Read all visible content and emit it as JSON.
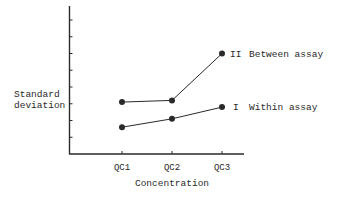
{
  "chart_data": {
    "type": "line",
    "title": "",
    "xlabel": "Concentration",
    "ylabel": "Standard deviation",
    "ylabel_lines": [
      "Standard",
      "deviation"
    ],
    "categories": [
      "QC1",
      "QC2",
      "QC3"
    ],
    "ylim": [
      0,
      8
    ],
    "yticks_count": 8,
    "ytick_labels": [],
    "grid": false,
    "legend_position": "inline-right",
    "series": [
      {
        "name": "Between assay",
        "marker_label": "II",
        "values": [
          3.1,
          3.2,
          6.0
        ]
      },
      {
        "name": "Within assay",
        "marker_label": "I",
        "values": [
          1.6,
          2.1,
          2.8
        ]
      }
    ]
  },
  "colors": {
    "ink": "#2a2a2a",
    "background": "#ffffff"
  }
}
